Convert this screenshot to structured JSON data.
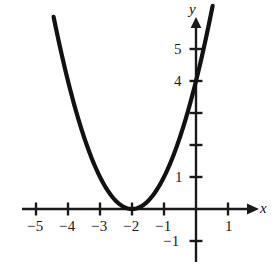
{
  "chart_data": {
    "type": "line",
    "title": "",
    "subtitle": "",
    "xlabel": "x",
    "ylabel": "y",
    "function": "y = (x + 2)^2",
    "vertex": [
      -2,
      0
    ],
    "y_intercept": 4,
    "xlim": [
      -5.6,
      1.6
    ],
    "ylim": [
      -1.6,
      6.2
    ],
    "x_ticks": [
      -5,
      -4,
      -3,
      -2,
      -1,
      1
    ],
    "x_tick_labels": [
      "−5",
      "−4",
      "−3",
      "−2",
      "−1",
      "1"
    ],
    "y_ticks": [
      -1,
      1,
      2,
      3,
      4,
      5
    ],
    "y_tick_labels": [
      "−1",
      "1",
      "",
      "",
      "4",
      "5"
    ],
    "grid": false,
    "legend": false,
    "legend_position": "none",
    "curve_color": "#111111",
    "axis_color": "#1a1a1a",
    "background_color": "#ffffff",
    "x_domain_drawn": [
      -4.45,
      0.52
    ],
    "x": [
      -4.45,
      -4.2,
      -3.9,
      -3.6,
      -3.3,
      -3.0,
      -2.7,
      -2.4,
      -2.1,
      -2.0,
      -1.9,
      -1.6,
      -1.3,
      -1.0,
      -0.7,
      -0.4,
      -0.1,
      0.2,
      0.52
    ],
    "y": [
      6.0,
      4.84,
      3.61,
      2.56,
      1.69,
      1.0,
      0.49,
      0.16,
      0.01,
      0.0,
      0.01,
      0.16,
      0.49,
      1.0,
      1.69,
      2.56,
      3.61,
      4.84,
      6.35
    ],
    "annotations": []
  },
  "axis_labels": {
    "x": "x",
    "y": "y"
  },
  "x_tick_text": {
    "t0": "−5",
    "t1": "−4",
    "t2": "−3",
    "t3": "−2",
    "t4": "−1",
    "t5": "1"
  },
  "y_tick_text": {
    "t_neg1": "−1",
    "t1": "1",
    "t4": "4",
    "t5": "5"
  }
}
